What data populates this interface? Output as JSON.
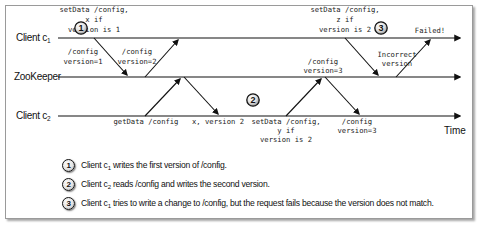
{
  "diagram": {
    "lanes": [
      {
        "id": "c1",
        "label": "Client c",
        "subscript": "1"
      },
      {
        "id": "zk",
        "label": "ZooKeeper"
      },
      {
        "id": "c2",
        "label": "Client c",
        "subscript": "2"
      }
    ],
    "time_label": "Time",
    "annotations": {
      "c1_setdata": [
        "setData /config,",
        "x if",
        "version is 1"
      ],
      "zk_reply1": [
        "/config",
        "version=1"
      ],
      "zk_reply2": [
        "/config",
        "version=2"
      ],
      "c2_getdata": "getData /config",
      "c2_getdata_reply": "x, version 2",
      "c2_setdata": [
        "setData /config,",
        "y if",
        "version is 2"
      ],
      "c2_setdata_reply": [
        "/config",
        "version=3"
      ],
      "zk_version3": [
        "/config",
        "version=3"
      ],
      "c1_setdata2": [
        "setData /config,",
        "z if",
        "version is 2"
      ],
      "incorrect_version": [
        "Incorrect",
        "version"
      ],
      "failed": "Failed!"
    },
    "callouts": [
      "1",
      "2",
      "3"
    ],
    "colors": {
      "line": "#111111",
      "border": "#9a9a9a",
      "text": "#222222"
    }
  },
  "legend": [
    {
      "num": "1",
      "prefix": "Client c",
      "sub": "1",
      "text": " writes the first version of /config."
    },
    {
      "num": "2",
      "prefix": "Client c",
      "sub": "2",
      "text": " reads /config and writes the second version."
    },
    {
      "num": "3",
      "prefix": "Client c",
      "sub": "1",
      "text": " tries to write a change to /config, but the request fails because the version does not match."
    }
  ]
}
